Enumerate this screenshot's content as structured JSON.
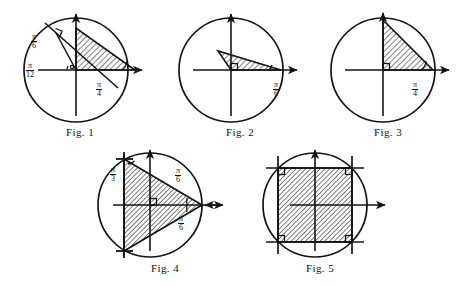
{
  "plate": {
    "title": "Geometric figures plate",
    "background_color": "#ffffff",
    "ink_color": "#141414",
    "hatch_color": "#4a4a4a"
  },
  "figures": [
    {
      "id": "fig1",
      "caption": "Fig. 1",
      "shape": "right-triangle-inscribed",
      "labels": [
        {
          "name": "angle-pi-over-6",
          "num": "π",
          "den": "6"
        },
        {
          "name": "angle-pi-over-12",
          "num": "π",
          "den": "12"
        },
        {
          "name": "angle-pi-over-4",
          "num": "π",
          "den": "4"
        }
      ]
    },
    {
      "id": "fig2",
      "caption": "Fig. 2",
      "shape": "right-triangle-inscribed",
      "labels": [
        {
          "name": "angle-pi-over-6",
          "num": "π",
          "den": "6"
        }
      ]
    },
    {
      "id": "fig3",
      "caption": "Fig. 3",
      "shape": "right-triangle-inscribed",
      "labels": [
        {
          "name": "angle-pi-over-4",
          "num": "π",
          "den": "4"
        }
      ]
    },
    {
      "id": "fig4",
      "caption": "Fig. 4",
      "shape": "isosceles-triangle-inscribed",
      "labels": [
        {
          "name": "angle-pi-over-3",
          "num": "π",
          "den": "3"
        },
        {
          "name": "angle-pi-over-6-upper",
          "num": "π",
          "den": "6"
        },
        {
          "name": "angle-pi-over-6-lower",
          "num": "π",
          "den": "6"
        }
      ]
    },
    {
      "id": "fig5",
      "caption": "Fig. 5",
      "shape": "square-inscribed",
      "labels": []
    }
  ]
}
